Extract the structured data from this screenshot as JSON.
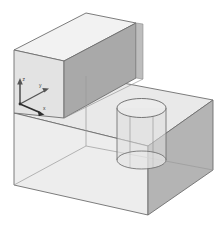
{
  "view": {
    "title": "Isometric solid model view",
    "background_color": "#ffffff",
    "projection": "isometric",
    "render_mode": "shaded-transparent-wireframe"
  },
  "model": {
    "name": "L-shaped stepped block with cylindrical through-hole",
    "description": "A stepped rectangular solid: a tall upper rectangular prism sitting on the rear-left portion of a larger lower rectangular base, with a vertical cylinder passing through the base on the right side.",
    "edge_color": "#6e6e6e",
    "hidden_edge_color": "#9a9a9a",
    "solids": [
      {
        "id": "upper-block",
        "label": "Upper block",
        "shape": "rectangular prism",
        "faces": [
          {
            "id": "upper-top-face",
            "label": "Top face",
            "color": "#f2f2f2"
          },
          {
            "id": "upper-left-face",
            "label": "Left face",
            "color": "#e3e3e3"
          },
          {
            "id": "upper-front-face",
            "label": "Front face",
            "color": "#a9a9a9"
          },
          {
            "id": "upper-right-face",
            "label": "Right face",
            "color": "#bdbdbd"
          }
        ]
      },
      {
        "id": "base-block",
        "label": "Base block",
        "shape": "rectangular prism",
        "faces": [
          {
            "id": "base-top-face",
            "label": "Top face",
            "color": "#e9e9e9"
          },
          {
            "id": "base-left-face",
            "label": "Front-left face",
            "color": "#ededed"
          },
          {
            "id": "base-right-face",
            "label": "Front-right face",
            "color": "#b4b4b4"
          }
        ]
      },
      {
        "id": "cylinder",
        "label": "Cylindrical hole",
        "shape": "cylinder",
        "faces": [
          {
            "id": "cylinder-top-ellipse",
            "label": "Top circle",
            "color": "#eeeeee"
          },
          {
            "id": "cylinder-bottom-ellipse",
            "label": "Bottom circle",
            "color": "#eaeaea"
          },
          {
            "id": "cylinder-wall",
            "label": "Cylindrical wall",
            "color": "#dedede"
          }
        ]
      }
    ]
  },
  "axis_triad": {
    "name": "coordinate-axis-indicator",
    "origin_color": "#2f2f2f",
    "axes": [
      {
        "id": "axis-z",
        "label": "z",
        "direction": "up",
        "color": "#555555"
      },
      {
        "id": "axis-y",
        "label": "y",
        "direction": "upper-right",
        "color": "#555555"
      },
      {
        "id": "axis-x",
        "label": "x",
        "direction": "lower-right",
        "color": "#2f2f2f"
      }
    ]
  }
}
